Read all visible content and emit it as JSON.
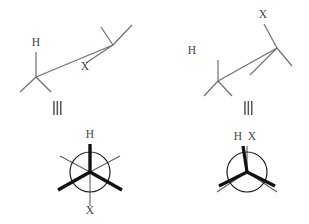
{
  "figure": {
    "colors": {
      "bond_line": "#6e6e6e",
      "bond_bold": "#111111",
      "label_text": "#3f3f3f",
      "circle_stroke": "#1a1a1a",
      "equivalence_mark": "#555555",
      "background": "#ffffff"
    },
    "panels": [
      {
        "id": "top-left",
        "name": "zigzag-anti",
        "type": "bond-line-structure",
        "conformation": "anti",
        "labels": [
          {
            "key": "h",
            "text": "H",
            "x": 36,
            "y": 46
          },
          {
            "key": "x",
            "text": "X",
            "x": 85,
            "y": 70
          }
        ]
      },
      {
        "id": "top-right",
        "name": "zigzag-syn",
        "type": "bond-line-structure",
        "conformation": "syn",
        "labels": [
          {
            "key": "x",
            "text": "X",
            "x": 263,
            "y": 18
          },
          {
            "key": "h",
            "text": "H",
            "x": 192,
            "y": 54
          }
        ]
      },
      {
        "id": "bottom-left",
        "name": "newman-staggered",
        "type": "newman-projection",
        "conformation": "staggered",
        "labels": [
          {
            "key": "h",
            "text": "H",
            "x": 90,
            "y": 138
          },
          {
            "key": "x",
            "text": "X",
            "x": 90,
            "y": 214
          }
        ]
      },
      {
        "id": "bottom-right",
        "name": "newman-eclipsed",
        "type": "newman-projection",
        "conformation": "eclipsed",
        "labels": [
          {
            "key": "h",
            "text": "H",
            "x": 238,
            "y": 140
          },
          {
            "key": "x",
            "text": "X",
            "x": 252,
            "y": 140
          }
        ]
      }
    ],
    "equivalence_marks": [
      {
        "key": "left",
        "symbol": "≡",
        "x": 57,
        "y": 108,
        "orientation": "vertical-bars"
      },
      {
        "key": "right",
        "symbol": "≡",
        "x": 248,
        "y": 108,
        "orientation": "vertical-bars"
      }
    ]
  }
}
